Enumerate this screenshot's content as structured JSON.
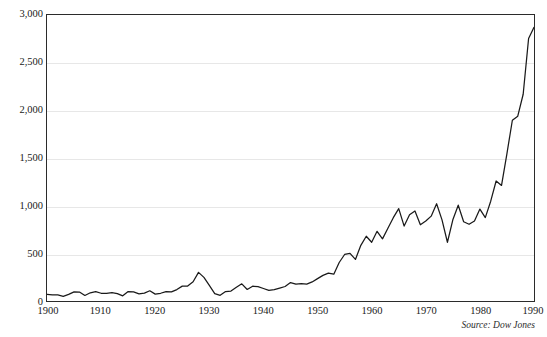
{
  "figure": {
    "title_sliver": "",
    "source_note": "Source: Dow Jones"
  },
  "chart_data": {
    "type": "line",
    "title": "",
    "subtitle": "",
    "xlabel": "",
    "ylabel": "",
    "xlim": [
      1900,
      1990
    ],
    "ylim": [
      0,
      3000
    ],
    "grid": true,
    "legend": null,
    "line_color": "#1a1a1a",
    "gridline_color": "#e7e7e7",
    "axis_color": "#2b2b2b",
    "background_color": "#ffffff",
    "y_ticks": [
      0,
      500,
      1000,
      1500,
      2000,
      2500,
      3000
    ],
    "y_tick_labels": [
      "0",
      "500",
      "1,000",
      "1,500",
      "2,000",
      "2,500",
      "3,000"
    ],
    "x_ticks": [
      1900,
      1910,
      1920,
      1930,
      1940,
      1950,
      1960,
      1970,
      1980,
      1990
    ],
    "x_tick_labels": [
      "1900",
      "1910",
      "1920",
      "1930",
      "1940",
      "1950",
      "1960",
      "1970",
      "1980",
      "1990"
    ],
    "series": [
      {
        "name": "Dow Jones Industrial Average",
        "x": [
          1900,
          1901,
          1902,
          1903,
          1904,
          1905,
          1906,
          1907,
          1908,
          1909,
          1910,
          1911,
          1912,
          1913,
          1914,
          1915,
          1916,
          1917,
          1918,
          1919,
          1920,
          1921,
          1922,
          1923,
          1924,
          1925,
          1926,
          1927,
          1928,
          1929,
          1930,
          1931,
          1932,
          1933,
          1934,
          1935,
          1936,
          1937,
          1938,
          1939,
          1940,
          1941,
          1942,
          1943,
          1944,
          1945,
          1946,
          1947,
          1948,
          1949,
          1950,
          1951,
          1952,
          1953,
          1954,
          1955,
          1956,
          1957,
          1958,
          1959,
          1960,
          1961,
          1962,
          1963,
          1964,
          1965,
          1966,
          1967,
          1968,
          1969,
          1970,
          1971,
          1972,
          1973,
          1974,
          1975,
          1976,
          1977,
          1978,
          1979,
          1980,
          1981,
          1982,
          1983,
          1984,
          1985,
          1986,
          1987,
          1988,
          1989,
          1990
        ],
        "values": [
          70,
          64,
          64,
          49,
          69,
          96,
          94,
          58,
          86,
          99,
          81,
          81,
          87,
          78,
          54,
          99,
          95,
          74,
          82,
          107,
          72,
          81,
          98,
          95,
          120,
          156,
          157,
          202,
          300,
          248,
          164,
          77,
          60,
          99,
          104,
          144,
          180,
          121,
          155,
          150,
          131,
          111,
          119,
          136,
          152,
          193,
          177,
          181,
          177,
          200,
          235,
          269,
          292,
          281,
          404,
          488,
          499,
          436,
          584,
          679,
          616,
          731,
          652,
          763,
          874,
          969,
          786,
          905,
          944,
          800,
          839,
          890,
          1020,
          851,
          616,
          852,
          1005,
          831,
          805,
          839,
          964,
          875,
          1047,
          1259,
          1212,
          1547,
          1896,
          1939,
          2169,
          2753,
          2870
        ],
        "annotations": [
          {
            "label": "1929 peak",
            "x": 1929,
            "y": 300
          },
          {
            "label": "1932 trough",
            "x": 1932,
            "y": 60
          },
          {
            "label": "1974 trough",
            "x": 1974,
            "y": 616
          },
          {
            "label": "1990 close",
            "x": 1990,
            "y": 2870
          }
        ]
      }
    ]
  }
}
